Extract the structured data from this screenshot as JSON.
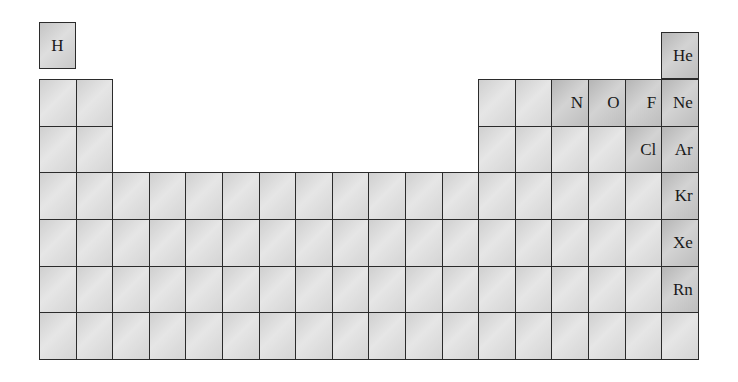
{
  "grid": {
    "left": 39,
    "col_width": 36.6,
    "columns": 18,
    "row_tops": [
      22,
      79,
      126,
      172,
      219,
      266,
      312
    ],
    "row_height": 46.7,
    "bottom": 359
  },
  "hydrogen": {
    "symbol": "H",
    "x": 39,
    "y": 22,
    "w": 37,
    "h": 47
  },
  "helium": {
    "symbol": "He",
    "col": 18,
    "y": 32,
    "h": 47
  },
  "rows": [
    {
      "period": 2,
      "cols": [
        1,
        2,
        13,
        14,
        15,
        16,
        17,
        18
      ]
    },
    {
      "period": 3,
      "cols": [
        1,
        2,
        13,
        14,
        15,
        16,
        17,
        18
      ]
    },
    {
      "period": 4,
      "cols": [
        1,
        2,
        3,
        4,
        5,
        6,
        7,
        8,
        9,
        10,
        11,
        12,
        13,
        14,
        15,
        16,
        17,
        18
      ]
    },
    {
      "period": 5,
      "cols": [
        1,
        2,
        3,
        4,
        5,
        6,
        7,
        8,
        9,
        10,
        11,
        12,
        13,
        14,
        15,
        16,
        17,
        18
      ]
    },
    {
      "period": 6,
      "cols": [
        1,
        2,
        3,
        4,
        5,
        6,
        7,
        8,
        9,
        10,
        11,
        12,
        13,
        14,
        15,
        16,
        17,
        18
      ]
    },
    {
      "period": 7,
      "cols": [
        1,
        2,
        3,
        4,
        5,
        6,
        7,
        8,
        9,
        10,
        11,
        12,
        13,
        14,
        15,
        16,
        17,
        18
      ]
    }
  ],
  "labels": [
    {
      "period": 2,
      "col": 15,
      "symbol": "N"
    },
    {
      "period": 2,
      "col": 16,
      "symbol": "O"
    },
    {
      "period": 2,
      "col": 17,
      "symbol": "F"
    },
    {
      "period": 2,
      "col": 18,
      "symbol": "Ne"
    },
    {
      "period": 3,
      "col": 17,
      "symbol": "Cl"
    },
    {
      "period": 3,
      "col": 18,
      "symbol": "Ar"
    },
    {
      "period": 4,
      "col": 18,
      "symbol": "Kr"
    },
    {
      "period": 5,
      "col": 18,
      "symbol": "Xe"
    },
    {
      "period": 6,
      "col": 18,
      "symbol": "Rn"
    }
  ]
}
